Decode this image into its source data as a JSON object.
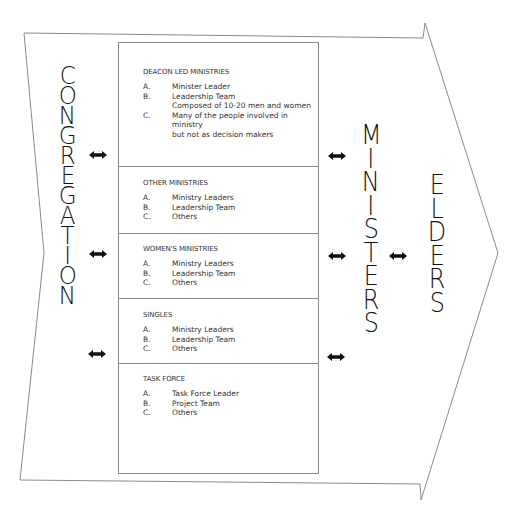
{
  "diagram": {
    "colors": {
      "line": "#8a8a8a",
      "text": "#111111",
      "arrow": "#111111"
    },
    "left_label": {
      "letters": [
        "C",
        "O",
        "N",
        "G",
        "R",
        "E",
        "G",
        "A",
        "T",
        "I",
        "O",
        "N"
      ],
      "word": "CONGREGATION"
    },
    "middle_label": {
      "letters": [
        "M",
        "I",
        "N",
        "I",
        "S",
        "T",
        "E",
        "R",
        "S"
      ],
      "word": "MINISTERS"
    },
    "right_label": {
      "letters": [
        "E",
        "L",
        "D",
        "E",
        "R",
        "S"
      ],
      "word": "ELDERS"
    },
    "sections": [
      {
        "title": "DEACON LED MINISTRIES",
        "items": [
          {
            "label": "A.",
            "text": "Minister Leader"
          },
          {
            "label": "B.",
            "text": "Leadership Team",
            "continuation": "Composed of 10-20 men and women"
          },
          {
            "label": "C.",
            "text": "Many of the people involved in ministry",
            "continuation": "but not as decision makers"
          }
        ]
      },
      {
        "title": "OTHER MINISTRIES",
        "items": [
          {
            "label": "A.",
            "text": "Ministry Leaders"
          },
          {
            "label": "B.",
            "text": "Leadership Team"
          },
          {
            "label": "C.",
            "text": "Others"
          }
        ]
      },
      {
        "title": "WOMEN'S MINISTRIES",
        "items": [
          {
            "label": "A.",
            "text": "Ministry Leaders"
          },
          {
            "label": "B.",
            "text": "Leadership Team"
          },
          {
            "label": "C.",
            "text": "Others"
          }
        ]
      },
      {
        "title": "SINGLES",
        "items": [
          {
            "label": "A.",
            "text": "Ministry Leaders"
          },
          {
            "label": "B.",
            "text": "Leadership Team"
          },
          {
            "label": "C.",
            "text": "Others"
          }
        ]
      },
      {
        "title": "TASK FORCE",
        "items": [
          {
            "label": "A.",
            "text": "Task Force Leader"
          },
          {
            "label": "B.",
            "text": "Project Team"
          },
          {
            "label": "C.",
            "text": "Others"
          }
        ]
      }
    ],
    "connectors": [
      {
        "from": "CONGREGATION",
        "to": "ministries box",
        "type": "double-arrow",
        "count": 3
      },
      {
        "from": "ministries box",
        "to": "MINISTERS",
        "type": "double-arrow",
        "count": 3
      },
      {
        "from": "MINISTERS",
        "to": "ELDERS",
        "type": "double-arrow",
        "count": 1
      }
    ]
  }
}
